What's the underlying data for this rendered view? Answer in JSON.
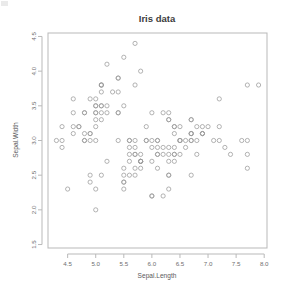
{
  "chart_data": {
    "type": "scatter",
    "title": "Iris data",
    "xlabel": "Sepal.Length",
    "ylabel": "Sepal.Width",
    "xlim": [
      4.15,
      8.05
    ],
    "ylim": [
      1.45,
      4.55
    ],
    "xticks": [
      4.5,
      5.0,
      5.5,
      6.0,
      6.5,
      7.0,
      7.5,
      8.0
    ],
    "xtick_labels": [
      "4.5",
      "5.0",
      "5.5",
      "6.0",
      "6.5",
      "7.0",
      "7.5",
      "8.0"
    ],
    "yticks": [
      1.5,
      2.0,
      2.5,
      3.0,
      3.5,
      4.0,
      4.5
    ],
    "ytick_labels": [
      "1.5",
      "2.0",
      "2.5",
      "3.0",
      "3.5",
      "4.0",
      "4.5"
    ],
    "grid": false,
    "legend": false,
    "point_marker": "open-circle",
    "point_radius": 2.1,
    "point_color": "#9a9a9a",
    "frame_color": "#b9b9b9",
    "background_color": "#ffffff",
    "n_points": 150,
    "x": [
      5.1,
      4.9,
      4.7,
      4.6,
      5.0,
      5.4,
      4.6,
      5.0,
      4.4,
      4.9,
      5.4,
      4.8,
      4.8,
      4.3,
      5.8,
      5.7,
      5.4,
      5.1,
      5.7,
      5.1,
      5.4,
      5.1,
      4.6,
      5.1,
      4.8,
      5.0,
      5.0,
      5.2,
      5.2,
      4.7,
      4.8,
      5.4,
      5.2,
      5.5,
      4.9,
      5.0,
      5.5,
      4.9,
      4.4,
      5.1,
      5.0,
      4.5,
      4.4,
      5.0,
      5.1,
      4.8,
      5.1,
      4.6,
      5.3,
      5.0,
      7.0,
      6.4,
      6.9,
      5.5,
      6.5,
      5.7,
      6.3,
      4.9,
      6.6,
      5.2,
      5.0,
      5.9,
      6.0,
      6.1,
      5.6,
      6.7,
      5.6,
      5.8,
      6.2,
      5.6,
      5.9,
      6.1,
      6.3,
      6.1,
      6.4,
      6.6,
      6.8,
      6.7,
      6.0,
      5.7,
      5.5,
      5.5,
      5.8,
      6.0,
      5.4,
      6.0,
      6.7,
      6.3,
      5.6,
      5.5,
      5.5,
      6.1,
      5.8,
      5.0,
      5.6,
      5.7,
      5.7,
      6.2,
      5.1,
      5.7,
      6.3,
      5.8,
      7.1,
      6.3,
      6.5,
      7.6,
      4.9,
      7.3,
      6.7,
      7.2,
      6.5,
      6.4,
      6.8,
      5.7,
      5.8,
      6.4,
      6.5,
      7.7,
      7.7,
      6.0,
      6.9,
      5.6,
      7.7,
      6.3,
      6.7,
      7.2,
      6.2,
      6.1,
      6.4,
      7.2,
      7.4,
      7.9,
      6.4,
      6.3,
      6.1,
      7.7,
      6.3,
      6.4,
      6.0,
      6.9,
      6.7,
      6.9,
      5.8,
      6.8,
      6.7,
      6.7,
      6.3,
      6.5,
      6.2,
      5.9
    ],
    "y": [
      3.5,
      3.0,
      3.2,
      3.1,
      3.6,
      3.9,
      3.4,
      3.4,
      2.9,
      3.1,
      3.7,
      3.4,
      3.0,
      3.0,
      4.0,
      4.4,
      3.9,
      3.5,
      3.8,
      3.8,
      3.4,
      3.7,
      3.6,
      3.3,
      3.4,
      3.0,
      3.4,
      3.5,
      3.4,
      3.2,
      3.1,
      3.4,
      4.1,
      4.2,
      3.1,
      3.2,
      3.5,
      3.6,
      3.0,
      3.4,
      3.5,
      2.3,
      3.2,
      3.5,
      3.8,
      3.0,
      3.8,
      3.2,
      3.7,
      3.3,
      3.2,
      3.2,
      3.1,
      2.3,
      2.8,
      2.8,
      3.3,
      2.4,
      2.9,
      2.7,
      2.0,
      3.0,
      2.2,
      2.9,
      2.9,
      3.1,
      3.0,
      2.7,
      2.2,
      2.5,
      3.2,
      2.8,
      2.5,
      2.8,
      2.9,
      3.0,
      2.8,
      3.0,
      2.9,
      2.6,
      2.4,
      2.4,
      2.7,
      2.7,
      3.0,
      3.4,
      3.1,
      2.3,
      3.0,
      2.5,
      2.6,
      3.0,
      2.6,
      2.3,
      2.7,
      3.0,
      2.9,
      2.9,
      2.5,
      2.8,
      3.3,
      2.7,
      3.0,
      2.9,
      3.0,
      3.0,
      2.5,
      2.9,
      2.5,
      3.6,
      3.2,
      2.7,
      3.0,
      2.5,
      2.8,
      3.2,
      3.0,
      3.8,
      2.6,
      2.2,
      3.2,
      2.8,
      2.8,
      2.7,
      3.3,
      3.2,
      2.8,
      3.0,
      2.8,
      3.0,
      2.8,
      3.8,
      2.8,
      2.8,
      2.6,
      3.0,
      3.4,
      3.1,
      3.0,
      3.1,
      3.1,
      3.1,
      2.7,
      3.2,
      3.3,
      3.0,
      2.5,
      3.0,
      3.4,
      3.0
    ]
  },
  "layout": {
    "frame": {
      "left": 48,
      "right": 267,
      "top": 33,
      "bottom": 248
    },
    "title_pos": {
      "x": 157,
      "y": 22
    },
    "xlabel_pos": {
      "x": 157,
      "y": 278
    },
    "ylabel_pos": {
      "x": 18,
      "y": 140
    }
  }
}
